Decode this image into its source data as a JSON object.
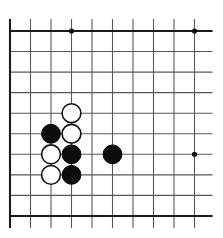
{
  "figure": {
    "kind": "go-board-diagram",
    "background_color": "#ffffff",
    "line_color": "#585858",
    "edge_color": "#1b1b1b",
    "black_color": "#0d0d0d",
    "white_color": "#ffffff"
  },
  "board": {
    "columns": 10,
    "rows": 10,
    "origin_x": 10,
    "origin_y": 31,
    "spacing_x": 20.5,
    "spacing_y": 20.55,
    "overhang_top": 12,
    "overhang_right": 18,
    "overhang_bottom": 12,
    "edges": [
      "left",
      "top",
      "bottom"
    ],
    "star_points": [
      {
        "col": 4,
        "row": 1
      },
      {
        "col": 10,
        "row": 1
      },
      {
        "col": 10,
        "row": 7
      }
    ]
  },
  "stones": [
    {
      "color": "black",
      "col": 3,
      "row": 6,
      "label": "black-stone-c3r6"
    },
    {
      "color": "black",
      "col": 4,
      "row": 7,
      "label": "black-stone-c4r7"
    },
    {
      "color": "black",
      "col": 4,
      "row": 8,
      "label": "black-stone-c4r8"
    },
    {
      "color": "black",
      "col": 6,
      "row": 7,
      "label": "black-stone-c6r7"
    },
    {
      "color": "white",
      "col": 4,
      "row": 5,
      "label": "white-stone-c4r5"
    },
    {
      "color": "white",
      "col": 4,
      "row": 6,
      "label": "white-stone-c4r6"
    },
    {
      "color": "white",
      "col": 3,
      "row": 7,
      "label": "white-stone-c3r7"
    },
    {
      "color": "white",
      "col": 3,
      "row": 8,
      "label": "white-stone-c3r8"
    }
  ],
  "stone_radius": 9.4,
  "star_radius": 2.6
}
